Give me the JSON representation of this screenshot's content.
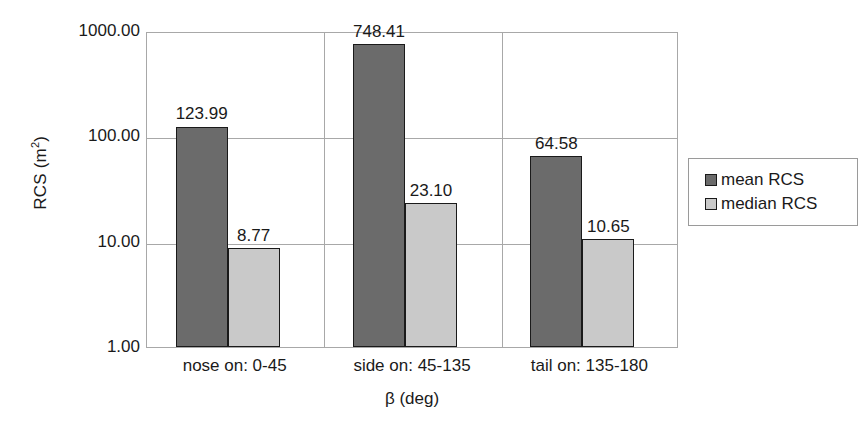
{
  "chart_data": {
    "type": "bar",
    "title": "",
    "xlabel": "β (deg)",
    "ylabel": "RCS (m²)",
    "ylabel_base": "RCS (m",
    "ylabel_sup": "2",
    "ylabel_close": ")",
    "yscale": "log",
    "ylim": [
      1,
      1000
    ],
    "ytick_labels": [
      "1000.00",
      "100.00",
      "10.00",
      "1.00"
    ],
    "ytick_values": [
      1000,
      100,
      10,
      1
    ],
    "grid": "horizontal-and-category-separators",
    "legend_position": "right",
    "categories": [
      "nose on:  0-45",
      "side on: 45-135",
      "tail on: 135-180"
    ],
    "series": [
      {
        "name": "mean RCS",
        "color": "#6b6b6b",
        "values": [
          123.99,
          748.41,
          64.58
        ],
        "labels": [
          "123.99",
          "748.41",
          "64.58"
        ]
      },
      {
        "name": "median RCS",
        "color": "#c9c9c9",
        "values": [
          8.77,
          23.1,
          10.65
        ],
        "labels": [
          "8.77",
          "23.10",
          "10.65"
        ]
      }
    ]
  },
  "legend": {
    "items": [
      {
        "label": "mean RCS",
        "swatch": "mean"
      },
      {
        "label": "median RCS",
        "swatch": "median"
      }
    ]
  }
}
